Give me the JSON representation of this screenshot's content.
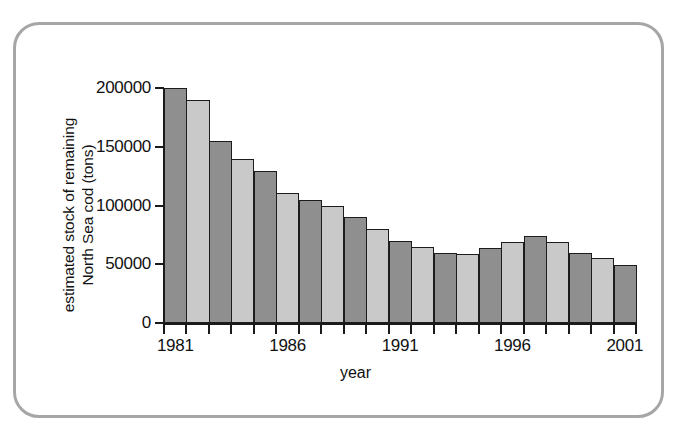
{
  "chart_data": {
    "type": "bar",
    "title": "",
    "xlabel": "year",
    "ylabel": "estimated stock of remaining North Sea cod (tons)",
    "categories": [
      1981,
      1982,
      1983,
      1984,
      1985,
      1986,
      1987,
      1988,
      1989,
      1990,
      1991,
      1992,
      1993,
      1994,
      1995,
      1996,
      1997,
      1998,
      1999,
      2000,
      2001
    ],
    "values": [
      200000,
      190000,
      155000,
      140000,
      129000,
      111000,
      105000,
      100000,
      90000,
      80000,
      70000,
      65000,
      60000,
      59000,
      64000,
      69000,
      74000,
      69000,
      60000,
      55000,
      49000
    ],
    "bar_colors": [
      "dark",
      "light",
      "dark",
      "light",
      "dark",
      "light",
      "dark",
      "light",
      "dark",
      "light",
      "dark",
      "light",
      "dark",
      "light",
      "dark",
      "light",
      "dark",
      "light",
      "dark",
      "light",
      "dark"
    ],
    "ylim": [
      0,
      200000
    ],
    "xlim": [
      1981,
      2002
    ],
    "y_ticks": [
      0,
      50000,
      100000,
      150000,
      200000
    ],
    "y_tick_labels": [
      "0",
      "50000",
      "100000",
      "150000",
      "200000"
    ],
    "x_tick_labels": [
      "1981",
      "1986",
      "1991",
      "1996",
      "2001"
    ],
    "x_tick_label_years": [
      1981,
      1986,
      1991,
      1996,
      2001
    ],
    "grid": false,
    "legend": "none",
    "colors": {
      "dark_bar": "#8f8f8f",
      "light_bar": "#c9c9c9",
      "bar_outline": "#1c1c1c",
      "axis": "#1a1a1a",
      "frame_border": "#a6a6a6",
      "background": "#ffffff"
    }
  },
  "axes": {
    "y_title_line1": "estimated stock of remaining",
    "y_title_line2": "North Sea cod (tons)",
    "x_title": "year"
  }
}
